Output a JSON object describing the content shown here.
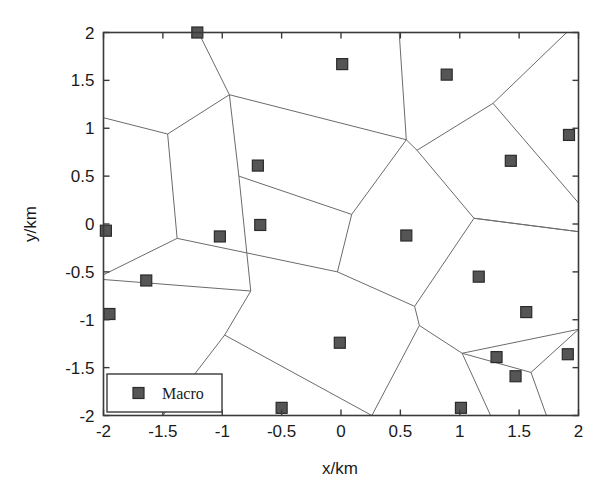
{
  "figure": {
    "background_color": "#ffffff",
    "axes_color": "#3a3a3a",
    "edge_color": "#6b6b6b",
    "marker_color": "#555555",
    "marker_edge_color": "#2b2b2b",
    "text_color": "#1a1a1a"
  },
  "chart_data": {
    "type": "scatter",
    "title": "",
    "xlabel": "x/km",
    "ylabel": "y/km",
    "xlim": [
      -2,
      2
    ],
    "ylim": [
      -2,
      2
    ],
    "xticks": [
      -2,
      -1.5,
      -1,
      -0.5,
      0,
      0.5,
      1,
      1.5,
      2
    ],
    "xtick_labels": [
      "-2",
      "-1.5",
      "-1",
      "-0.5",
      "0",
      "0.5",
      "1",
      "1.5",
      "2"
    ],
    "yticks": [
      -2,
      -1.5,
      -1,
      -0.5,
      0,
      0.5,
      1,
      1.5,
      2
    ],
    "ytick_labels": [
      "-2",
      "-1.5",
      "-1",
      "-0.5",
      "0",
      "0.5",
      "1",
      "1.5",
      "2"
    ],
    "grid": false,
    "legend": {
      "position": "lower-left",
      "entries": [
        {
          "label": "Macro",
          "marker": "square",
          "color": "#555555"
        }
      ]
    },
    "series": [
      {
        "name": "Macro",
        "marker": "square",
        "points": [
          {
            "x": -1.21,
            "y": 2.0
          },
          {
            "x": 0.01,
            "y": 1.67
          },
          {
            "x": 0.89,
            "y": 1.56
          },
          {
            "x": 1.92,
            "y": 0.93
          },
          {
            "x": -0.7,
            "y": 0.61
          },
          {
            "x": 1.43,
            "y": 0.66
          },
          {
            "x": -1.98,
            "y": -0.07
          },
          {
            "x": -1.02,
            "y": -0.13
          },
          {
            "x": -0.68,
            "y": -0.01
          },
          {
            "x": 0.55,
            "y": -0.12
          },
          {
            "x": -1.64,
            "y": -0.59
          },
          {
            "x": 1.16,
            "y": -0.55
          },
          {
            "x": -1.95,
            "y": -0.94
          },
          {
            "x": 1.56,
            "y": -0.92
          },
          {
            "x": -0.01,
            "y": -1.24
          },
          {
            "x": 1.31,
            "y": -1.39
          },
          {
            "x": 1.91,
            "y": -1.36
          },
          {
            "x": 1.47,
            "y": -1.59
          },
          {
            "x": -0.5,
            "y": -1.92
          },
          {
            "x": 1.01,
            "y": -1.92
          }
        ]
      }
    ],
    "voronoi_edges": [
      {
        "x1": -2.0,
        "y1": 1.11,
        "x2": -1.46,
        "y2": 0.94
      },
      {
        "x1": -1.46,
        "y1": 0.94,
        "x2": -0.94,
        "y2": 1.35
      },
      {
        "x1": -0.94,
        "y1": 1.35,
        "x2": -1.2,
        "y2": 2.0
      },
      {
        "x1": -0.94,
        "y1": 1.35,
        "x2": 0.55,
        "y2": 0.88
      },
      {
        "x1": 0.55,
        "y1": 0.88,
        "x2": 0.49,
        "y2": 2.0
      },
      {
        "x1": 0.55,
        "y1": 0.88,
        "x2": 0.64,
        "y2": 0.77
      },
      {
        "x1": 0.64,
        "y1": 0.77,
        "x2": 1.28,
        "y2": 1.26
      },
      {
        "x1": 1.28,
        "y1": 1.26,
        "x2": 1.9,
        "y2": 2.0
      },
      {
        "x1": 1.28,
        "y1": 1.26,
        "x2": 2.0,
        "y2": 0.22
      },
      {
        "x1": 0.64,
        "y1": 0.77,
        "x2": 1.12,
        "y2": 0.06
      },
      {
        "x1": 1.12,
        "y1": 0.06,
        "x2": 2.0,
        "y2": -0.08
      },
      {
        "x1": -1.46,
        "y1": 0.94,
        "x2": -1.38,
        "y2": -0.15
      },
      {
        "x1": -1.38,
        "y1": -0.15,
        "x2": -2.0,
        "y2": -0.53
      },
      {
        "x1": -1.38,
        "y1": -0.15,
        "x2": -0.03,
        "y2": -0.5
      },
      {
        "x1": -0.94,
        "y1": 1.35,
        "x2": -0.86,
        "y2": 0.5
      },
      {
        "x1": -0.86,
        "y1": 0.5,
        "x2": 0.09,
        "y2": 0.1
      },
      {
        "x1": -0.86,
        "y1": 0.5,
        "x2": -0.8,
        "y2": -0.22
      },
      {
        "x1": -0.8,
        "y1": -0.22,
        "x2": -0.76,
        "y2": -0.7
      },
      {
        "x1": 0.09,
        "y1": 0.1,
        "x2": 0.55,
        "y2": 0.88
      },
      {
        "x1": 0.09,
        "y1": 0.1,
        "x2": -0.03,
        "y2": -0.5
      },
      {
        "x1": -0.03,
        "y1": -0.5,
        "x2": 0.62,
        "y2": -0.86
      },
      {
        "x1": 0.62,
        "y1": -0.86,
        "x2": 1.12,
        "y2": 0.06
      },
      {
        "x1": 0.62,
        "y1": -0.86,
        "x2": 0.66,
        "y2": -1.06
      },
      {
        "x1": 0.66,
        "y1": -1.06,
        "x2": 1.02,
        "y2": -1.35
      },
      {
        "x1": 0.66,
        "y1": -1.06,
        "x2": 0.26,
        "y2": -2.0
      },
      {
        "x1": -0.76,
        "y1": -0.7,
        "x2": -2.0,
        "y2": -0.58
      },
      {
        "x1": -0.76,
        "y1": -0.7,
        "x2": -0.98,
        "y2": -1.16
      },
      {
        "x1": -0.98,
        "y1": -1.16,
        "x2": -1.5,
        "y2": -2.0
      },
      {
        "x1": -0.98,
        "y1": -1.16,
        "x2": 0.26,
        "y2": -2.0
      },
      {
        "x1": 1.02,
        "y1": -1.35,
        "x2": 2.0,
        "y2": -1.1
      },
      {
        "x1": 1.02,
        "y1": -1.35,
        "x2": 1.26,
        "y2": -2.0
      },
      {
        "x1": 1.12,
        "y1": 0.06,
        "x2": 2.0,
        "y2": -0.08
      },
      {
        "x1": 1.02,
        "y1": -1.35,
        "x2": 1.6,
        "y2": -1.55
      },
      {
        "x1": 1.6,
        "y1": -1.55,
        "x2": 1.73,
        "y2": -2.0
      },
      {
        "x1": 1.6,
        "y1": -1.55,
        "x2": 2.0,
        "y2": -1.1
      }
    ]
  }
}
